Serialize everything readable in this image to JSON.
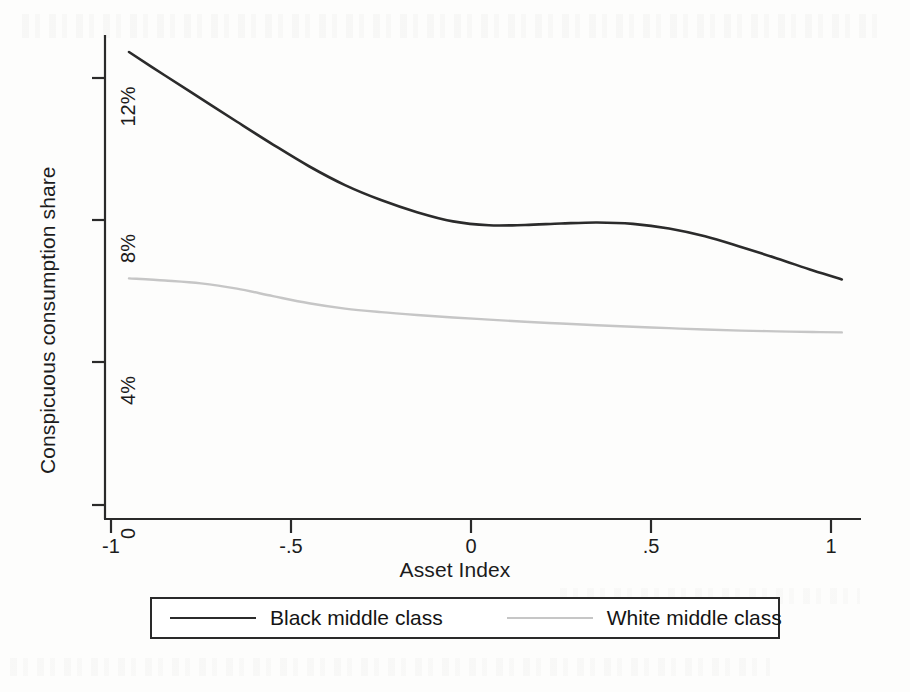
{
  "chart_data": {
    "type": "line",
    "title": "",
    "xlabel": "Asset Index",
    "ylabel": "Conspicuous consumption share",
    "xlim": [
      -1.05,
      1.08
    ],
    "ylim": [
      0,
      13.4
    ],
    "grid": false,
    "legend_position": "bottom",
    "x_tick_labels": [
      "-1",
      "-.5",
      "0",
      ".5",
      "1"
    ],
    "x_tick_values": [
      -1,
      -0.5,
      0,
      0.5,
      1
    ],
    "y_tick_labels": [
      "0",
      "4%",
      "8%",
      "12%"
    ],
    "y_tick_values": [
      0,
      4,
      8,
      12
    ],
    "x": [
      -0.95,
      -0.85,
      -0.75,
      -0.65,
      -0.55,
      -0.45,
      -0.35,
      -0.25,
      -0.15,
      -0.05,
      0.05,
      0.15,
      0.25,
      0.35,
      0.45,
      0.55,
      0.65,
      0.75,
      0.85,
      0.95,
      1.03
    ],
    "series": [
      {
        "name": "Black middle class",
        "color": "#2b2b2b",
        "values": [
          12.73,
          12.07,
          11.42,
          10.77,
          10.13,
          9.52,
          8.99,
          8.57,
          8.23,
          7.97,
          7.86,
          7.87,
          7.91,
          7.94,
          7.9,
          7.77,
          7.55,
          7.25,
          6.93,
          6.59,
          6.34
        ]
      },
      {
        "name": "White middle class",
        "color": "#c6c6c6",
        "values": [
          6.37,
          6.31,
          6.23,
          6.08,
          5.87,
          5.67,
          5.52,
          5.42,
          5.34,
          5.27,
          5.21,
          5.15,
          5.1,
          5.05,
          5.01,
          4.97,
          4.93,
          4.9,
          4.88,
          4.86,
          4.85
        ]
      }
    ]
  },
  "legend": {
    "items": [
      {
        "label": "Black middle class",
        "color": "#2b2b2b"
      },
      {
        "label": "White middle class",
        "color": "#c6c6c6"
      }
    ]
  },
  "axes": {
    "y_title": "Conspicuous consumption share",
    "x_title": "Asset Index",
    "y_ticks": [
      "12%",
      "8%",
      "4%",
      "0"
    ],
    "x_ticks": [
      "-1",
      "-.5",
      "0",
      ".5",
      "1"
    ]
  },
  "colors": {
    "black_series": "#2b2b2b",
    "white_series": "#c6c6c6",
    "axis": "#2a2a2a",
    "background": "#fdfdfc"
  }
}
